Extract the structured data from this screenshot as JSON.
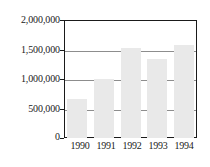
{
  "chart_data": {
    "type": "bar",
    "title": "",
    "subtitle": "",
    "xlabel": "",
    "ylabel": "",
    "categories": [
      "1990",
      "1991",
      "1992",
      "1993",
      "1994"
    ],
    "values": [
      660000,
      1000000,
      1525000,
      1340000,
      1575000
    ],
    "series": [
      {
        "name": "",
        "values": [
          660000,
          1000000,
          1525000,
          1340000,
          1575000
        ]
      }
    ],
    "ylim": [
      0,
      2000000
    ],
    "ytick_values": [
      0,
      500000,
      1000000,
      1500000,
      2000000
    ],
    "ytick_labels": [
      "0",
      "500,000",
      "1,000,000",
      "1,500,000",
      "2,000,000"
    ],
    "xtick_labels": [
      "1990",
      "1991",
      "1992",
      "1993",
      "1994"
    ],
    "grid": true,
    "grid_axis": "y",
    "legend": false,
    "legend_position": "none",
    "annotations": [],
    "colors": {
      "bar_fill": "#e9e9e9",
      "frame": "#1a1a1a",
      "gridline": "#8d8d8d",
      "text": "#1a1a1a",
      "background": "#ffffff"
    }
  }
}
